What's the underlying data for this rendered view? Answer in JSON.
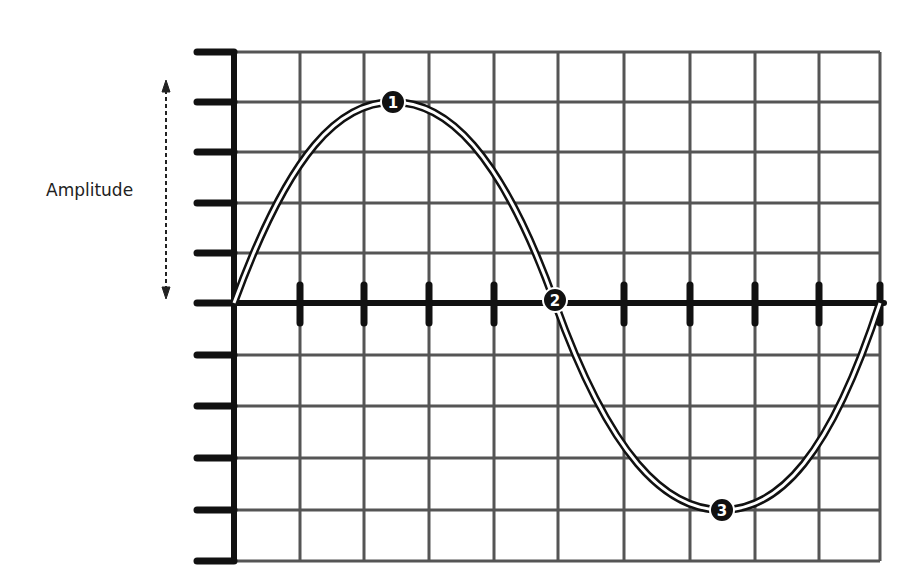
{
  "diagram": {
    "amplitude_label": "Amplitude",
    "markers": [
      {
        "id": "1",
        "label": "1",
        "description": "crest (maximum)"
      },
      {
        "id": "2",
        "label": "2",
        "description": "zero crossing"
      },
      {
        "id": "3",
        "label": "3",
        "description": "trough (minimum)"
      }
    ],
    "grid": {
      "columns": 10,
      "rows": 10,
      "axis_row": 5
    },
    "colors": {
      "grid": "#555555",
      "axis": "#111111",
      "curve_outline": "#111111",
      "curve_fill": "#ffffff",
      "marker": "#111111",
      "marker_text": "#ffffff"
    }
  }
}
